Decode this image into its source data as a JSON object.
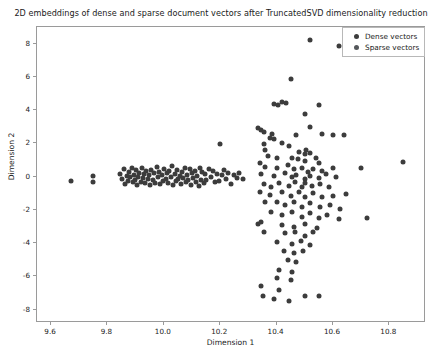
{
  "chart_data": {
    "type": "scatter",
    "title": "2D embeddings of dense and sparse document vectors after TruncatedSVD dimensionality reduction",
    "xlabel": "Dimension 1",
    "ylabel": "Dimension 2",
    "xlim": [
      9.55,
      10.93
    ],
    "ylim": [
      -8.8,
      9.0
    ],
    "xticks": [
      9.6,
      9.8,
      10.0,
      10.2,
      10.4,
      10.6,
      10.8
    ],
    "xticklabels": [
      "9.6",
      "9.8",
      "10.0",
      "10.2",
      "10.4",
      "10.6",
      "10.8"
    ],
    "yticks": [
      -8,
      -6,
      -4,
      -2,
      0,
      2,
      4,
      6,
      8
    ],
    "yticklabels": [
      "-8",
      "-6",
      "-4",
      "-2",
      "0",
      "2",
      "4",
      "6",
      "8"
    ],
    "grid": false,
    "legend_position": "upper right",
    "marker_color": "#3c3c3c",
    "marker_size": 5,
    "series": [
      {
        "name": "Dense vectors",
        "color": "#3c3c3c",
        "points": [
          [
            9.672,
            -0.26
          ],
          [
            9.747,
            0.02
          ],
          [
            9.749,
            -0.33
          ],
          [
            9.843,
            0.18
          ],
          [
            9.851,
            -0.12
          ],
          [
            9.857,
            0.46
          ],
          [
            9.862,
            -0.42
          ],
          [
            9.868,
            0.05
          ],
          [
            9.872,
            -0.25
          ],
          [
            9.877,
            0.3
          ],
          [
            9.881,
            -0.05
          ],
          [
            9.886,
            0.55
          ],
          [
            9.889,
            -0.35
          ],
          [
            9.893,
            0.12
          ],
          [
            9.898,
            -0.18
          ],
          [
            9.902,
            0.38
          ],
          [
            9.905,
            -0.48
          ],
          [
            9.909,
            0.0
          ],
          [
            9.913,
            0.25
          ],
          [
            9.918,
            -0.3
          ],
          [
            9.921,
            0.52
          ],
          [
            9.925,
            -0.08
          ],
          [
            9.93,
            0.15
          ],
          [
            9.934,
            -0.4
          ],
          [
            9.938,
            0.33
          ],
          [
            9.942,
            -0.15
          ],
          [
            9.947,
            0.08
          ],
          [
            9.951,
            -0.52
          ],
          [
            9.956,
            0.42
          ],
          [
            9.96,
            -0.22
          ],
          [
            9.964,
            0.2
          ],
          [
            9.97,
            -0.36
          ],
          [
            9.975,
            0.6
          ],
          [
            9.979,
            -0.02
          ],
          [
            9.984,
            0.28
          ],
          [
            9.988,
            -0.45
          ],
          [
            9.993,
            0.1
          ],
          [
            9.997,
            -0.28
          ],
          [
            10.002,
            0.48
          ],
          [
            10.006,
            -0.12
          ],
          [
            10.011,
            0.22
          ],
          [
            10.015,
            -0.38
          ],
          [
            10.02,
            0.35
          ],
          [
            10.024,
            -0.05
          ],
          [
            10.029,
            0.62
          ],
          [
            10.033,
            -0.5
          ],
          [
            10.038,
            0.18
          ],
          [
            10.042,
            -0.25
          ],
          [
            10.047,
            0.4
          ],
          [
            10.051,
            -0.15
          ],
          [
            10.056,
            0.05
          ],
          [
            10.06,
            -0.42
          ],
          [
            10.065,
            0.3
          ],
          [
            10.069,
            -0.08
          ],
          [
            10.074,
            0.5
          ],
          [
            10.078,
            -0.33
          ],
          [
            10.083,
            0.12
          ],
          [
            10.087,
            -0.2
          ],
          [
            10.092,
            0.44
          ],
          [
            10.096,
            -0.48
          ],
          [
            10.101,
            0.25
          ],
          [
            10.105,
            -0.1
          ],
          [
            10.11,
            0.36
          ],
          [
            10.114,
            -0.3
          ],
          [
            10.119,
            0.02
          ],
          [
            10.123,
            -0.55
          ],
          [
            10.128,
            0.55
          ],
          [
            10.132,
            -0.18
          ],
          [
            10.137,
            0.28
          ],
          [
            10.141,
            -0.4
          ],
          [
            10.146,
            0.15
          ],
          [
            10.15,
            -0.22
          ],
          [
            10.16,
            0.45
          ],
          [
            10.168,
            -0.05
          ],
          [
            10.175,
            0.32
          ],
          [
            10.182,
            -0.35
          ],
          [
            10.19,
            0.18
          ],
          [
            10.197,
            -0.28
          ],
          [
            10.205,
            0.08
          ],
          [
            10.212,
            0.4
          ],
          [
            10.22,
            -0.16
          ],
          [
            10.228,
            0.24
          ],
          [
            10.238,
            -0.42
          ],
          [
            10.248,
            0.1
          ],
          [
            10.258,
            -0.06
          ],
          [
            10.268,
            0.2
          ]
        ]
      },
      {
        "name": "Sparse vectors",
        "color": "#3c3c3c",
        "points": [
          [
            10.2,
            1.95
          ],
          [
            10.28,
            -0.12
          ],
          [
            10.52,
            8.2
          ],
          [
            10.62,
            7.85
          ],
          [
            10.45,
            5.9
          ],
          [
            10.39,
            4.35
          ],
          [
            10.42,
            4.5
          ],
          [
            10.405,
            4.3
          ],
          [
            10.435,
            4.4
          ],
          [
            10.5,
            3.75
          ],
          [
            10.55,
            4.3
          ],
          [
            10.335,
            2.95
          ],
          [
            10.345,
            2.82
          ],
          [
            10.355,
            2.7
          ],
          [
            10.375,
            2.35
          ],
          [
            10.385,
            2.55
          ],
          [
            10.39,
            2.25
          ],
          [
            10.47,
            2.5
          ],
          [
            10.52,
            3.0
          ],
          [
            10.56,
            2.55
          ],
          [
            10.6,
            2.5
          ],
          [
            10.64,
            2.5
          ],
          [
            10.355,
            1.95
          ],
          [
            10.36,
            1.6
          ],
          [
            10.42,
            2.05
          ],
          [
            10.445,
            1.85
          ],
          [
            10.48,
            1.5
          ],
          [
            10.5,
            1.35
          ],
          [
            10.505,
            1.6
          ],
          [
            10.52,
            1.4
          ],
          [
            10.37,
            1.25
          ],
          [
            10.4,
            1.1
          ],
          [
            10.455,
            1.15
          ],
          [
            10.475,
            1.05
          ],
          [
            10.5,
            0.95
          ],
          [
            10.54,
            1.1
          ],
          [
            10.55,
            0.85
          ],
          [
            10.34,
            0.85
          ],
          [
            10.36,
            0.6
          ],
          [
            10.4,
            0.55
          ],
          [
            10.44,
            0.7
          ],
          [
            10.46,
            0.45
          ],
          [
            10.49,
            0.55
          ],
          [
            10.51,
            0.3
          ],
          [
            10.53,
            0.45
          ],
          [
            10.56,
            0.35
          ],
          [
            10.6,
            0.5
          ],
          [
            10.7,
            0.55
          ],
          [
            10.85,
            0.9
          ],
          [
            10.345,
            0.15
          ],
          [
            10.39,
            0.05
          ],
          [
            10.43,
            0.2
          ],
          [
            10.455,
            -0.05
          ],
          [
            10.47,
            0.1
          ],
          [
            10.5,
            -0.15
          ],
          [
            10.52,
            0.05
          ],
          [
            10.55,
            -0.1
          ],
          [
            10.575,
            0.15
          ],
          [
            10.61,
            -0.05
          ],
          [
            10.355,
            -0.45
          ],
          [
            10.38,
            -0.6
          ],
          [
            10.41,
            -0.4
          ],
          [
            10.445,
            -0.55
          ],
          [
            10.465,
            -0.35
          ],
          [
            10.49,
            -0.6
          ],
          [
            10.5,
            -0.4
          ],
          [
            10.525,
            -0.55
          ],
          [
            10.555,
            -0.45
          ],
          [
            10.585,
            -0.65
          ],
          [
            10.34,
            -0.95
          ],
          [
            10.375,
            -1.1
          ],
          [
            10.42,
            -0.9
          ],
          [
            10.45,
            -1.15
          ],
          [
            10.48,
            -0.95
          ],
          [
            10.5,
            -1.25
          ],
          [
            10.53,
            -1.0
          ],
          [
            10.56,
            -1.2
          ],
          [
            10.6,
            -1.15
          ],
          [
            10.645,
            -1.05
          ],
          [
            10.36,
            -1.55
          ],
          [
            10.4,
            -1.5
          ],
          [
            10.43,
            -1.7
          ],
          [
            10.46,
            -1.55
          ],
          [
            10.49,
            -1.8
          ],
          [
            10.52,
            -1.6
          ],
          [
            10.555,
            -1.85
          ],
          [
            10.59,
            -1.7
          ],
          [
            10.625,
            -1.95
          ],
          [
            10.38,
            -2.15
          ],
          [
            10.42,
            -2.3
          ],
          [
            10.455,
            -2.1
          ],
          [
            10.49,
            -2.4
          ],
          [
            10.52,
            -2.2
          ],
          [
            10.55,
            -2.5
          ],
          [
            10.58,
            -2.3
          ],
          [
            10.62,
            -2.55
          ],
          [
            10.72,
            -2.5
          ],
          [
            10.335,
            -2.85
          ],
          [
            10.345,
            -2.7
          ],
          [
            10.42,
            -2.9
          ],
          [
            10.46,
            -3.05
          ],
          [
            10.5,
            -2.85
          ],
          [
            10.545,
            -3.1
          ],
          [
            10.355,
            -3.3
          ],
          [
            10.43,
            -3.4
          ],
          [
            10.465,
            -3.3
          ],
          [
            10.5,
            -3.55
          ],
          [
            10.53,
            -3.35
          ],
          [
            10.4,
            -3.9
          ],
          [
            10.455,
            -4.05
          ],
          [
            10.485,
            -3.85
          ],
          [
            10.52,
            -4.1
          ],
          [
            10.425,
            -4.5
          ],
          [
            10.46,
            -4.6
          ],
          [
            10.495,
            -4.45
          ],
          [
            10.44,
            -5.0
          ],
          [
            10.47,
            -5.15
          ],
          [
            10.41,
            -5.6
          ],
          [
            10.455,
            -5.75
          ],
          [
            10.4,
            -6.1
          ],
          [
            10.45,
            -6.2
          ],
          [
            10.345,
            -6.55
          ],
          [
            10.41,
            -6.8
          ],
          [
            10.35,
            -7.15
          ],
          [
            10.39,
            -7.35
          ],
          [
            10.445,
            -7.5
          ],
          [
            10.5,
            -7.2
          ],
          [
            10.55,
            -7.15
          ]
        ]
      }
    ]
  },
  "legend": {
    "entries": [
      {
        "label": "Dense vectors",
        "marker": "circle-marker-dense"
      },
      {
        "label": "Sparse vectors",
        "marker": "circle-marker-sparse"
      }
    ]
  }
}
